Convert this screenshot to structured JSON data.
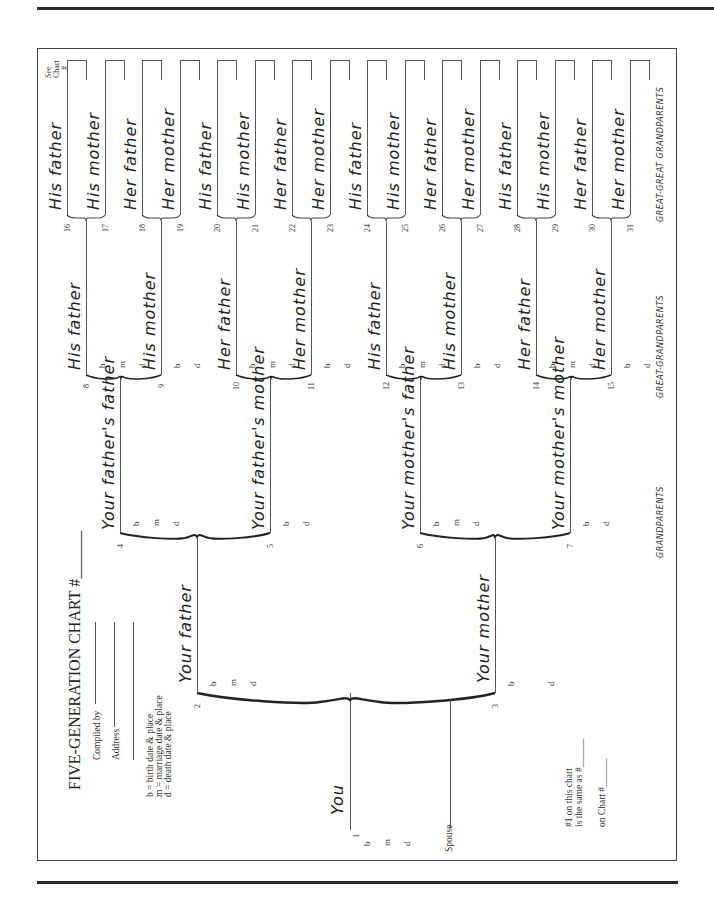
{
  "form": {
    "title": "FIVE-GENERATION CHART #______",
    "compiled_by": "Compiled by",
    "address": "Address",
    "legend": [
      "b = birth date & place",
      "m = marriage date & place",
      "d = death date & place"
    ],
    "same_as_1": "#1 on this chart",
    "same_as_2": "is the same as #______",
    "on_chart": "on Chart #______",
    "see_chart_1": "See",
    "see_chart_2": "Chart",
    "see_chart_3": "#",
    "spouse": "Spouse"
  },
  "generation_labels": {
    "grandparents": "GRANDPARENTS",
    "great_grandparents": "GREAT-GRANDPARENTS",
    "great_great_grandparents": "GREAT-GREAT GRANDPARENTS"
  },
  "fields": {
    "b": "b",
    "m": "m",
    "d": "d"
  },
  "people": {
    "p1": {
      "num": "1",
      "name": "You"
    },
    "p2": {
      "num": "2",
      "name": "Your father"
    },
    "p3": {
      "num": "3",
      "name": "Your mother"
    },
    "p4": {
      "num": "4",
      "name": "Your father's father"
    },
    "p5": {
      "num": "5",
      "name": "Your father's mother"
    },
    "p6": {
      "num": "6",
      "name": "Your mother's father"
    },
    "p7": {
      "num": "7",
      "name": "Your mother's mother"
    },
    "p8": {
      "num": "8",
      "name": "His father"
    },
    "p9": {
      "num": "9",
      "name": "His mother"
    },
    "p10": {
      "num": "10",
      "name": "Her father"
    },
    "p11": {
      "num": "11",
      "name": "Her mother"
    },
    "p12": {
      "num": "12",
      "name": "His father"
    },
    "p13": {
      "num": "13",
      "name": "His mother"
    },
    "p14": {
      "num": "14",
      "name": "Her father"
    },
    "p15": {
      "num": "15",
      "name": "Her mother"
    },
    "p16": {
      "num": "16",
      "name": "His father"
    },
    "p17": {
      "num": "17",
      "name": "His mother"
    },
    "p18": {
      "num": "18",
      "name": "Her father"
    },
    "p19": {
      "num": "19",
      "name": "Her mother"
    },
    "p20": {
      "num": "20",
      "name": "His father"
    },
    "p21": {
      "num": "21",
      "name": "His mother"
    },
    "p22": {
      "num": "22",
      "name": "Her father"
    },
    "p23": {
      "num": "23",
      "name": "Her mother"
    },
    "p24": {
      "num": "24",
      "name": "His father"
    },
    "p25": {
      "num": "25",
      "name": "His mother"
    },
    "p26": {
      "num": "26",
      "name": "Her father"
    },
    "p27": {
      "num": "27",
      "name": "Her mother"
    },
    "p28": {
      "num": "28",
      "name": "His father"
    },
    "p29": {
      "num": "29",
      "name": "His mother"
    },
    "p30": {
      "num": "30",
      "name": "Her father"
    },
    "p31": {
      "num": "31",
      "name": "Her mother"
    }
  }
}
